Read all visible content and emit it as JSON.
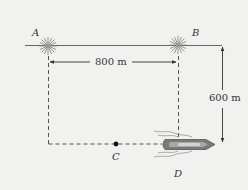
{
  "diagram": {
    "points": [
      {
        "id": "A",
        "label": "A",
        "kind": "light-beacon",
        "x": 48,
        "y": 46
      },
      {
        "id": "B",
        "label": "B",
        "kind": "light-beacon",
        "x": 178,
        "y": 45
      },
      {
        "id": "C",
        "label": "C",
        "kind": "point",
        "x": 116,
        "y": 144
      },
      {
        "id": "D",
        "label": "D",
        "kind": "boat",
        "x": 188,
        "y": 144
      }
    ],
    "dimensions": {
      "horizontal": {
        "label": "800 m",
        "from": "A",
        "to": "B"
      },
      "vertical": {
        "label": "600 m",
        "from": "shoreline",
        "to": "boat-path"
      }
    },
    "colors": {
      "background": "#f1f1f0",
      "line": "#555555",
      "beacon": "#888888",
      "boat_hull": "#7a7a7a",
      "boat_inner": "#c8c8c8"
    }
  }
}
